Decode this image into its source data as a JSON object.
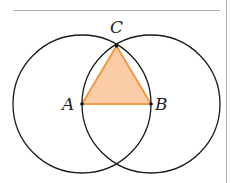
{
  "diagram": {
    "colors": {
      "circle_stroke": "#1a1a1a",
      "triangle_fill": "#f9c89c",
      "triangle_stroke": "#ef9a48",
      "frame_line": "#b0b0b0",
      "point": "#111111"
    },
    "points": {
      "A": {
        "label": "A",
        "x": 82,
        "y": 104
      },
      "B": {
        "label": "B",
        "x": 151,
        "y": 104
      },
      "C": {
        "label": "C",
        "x": 116.5,
        "y": 46
      }
    },
    "circles": [
      {
        "name": "circle-centered-A",
        "cx": 82,
        "cy": 104,
        "r": 69
      },
      {
        "name": "circle-centered-B",
        "cx": 151,
        "cy": 104,
        "r": 69
      }
    ],
    "labels": {
      "A": "A",
      "B": "B",
      "C": "C"
    }
  }
}
